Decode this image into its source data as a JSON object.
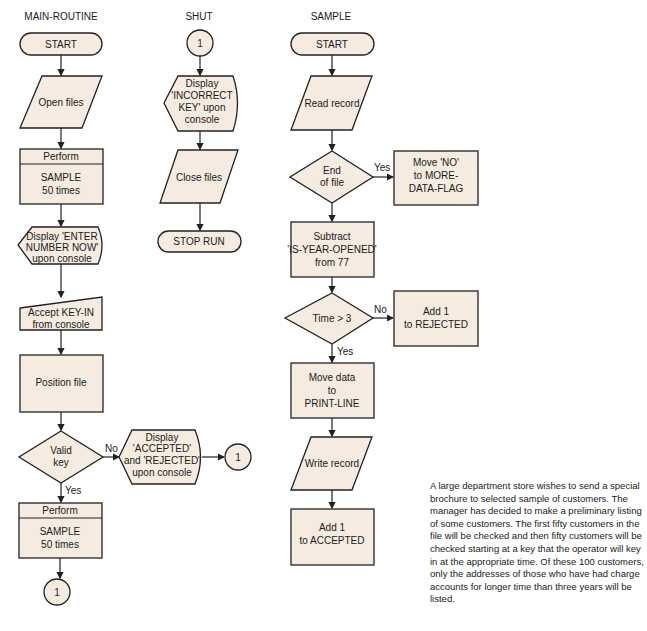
{
  "columns": {
    "main": {
      "title": "MAIN-ROUTINE",
      "start": "START",
      "open_files": "Open files",
      "perform1": {
        "header": "Perform",
        "line1": "SAMPLE",
        "line2": "50 times"
      },
      "display_enter": {
        "line1": "Display 'ENTER",
        "line2": "NUMBER NOW'",
        "line3": "upon console"
      },
      "accept": {
        "line1": "Accept KEY-IN",
        "line2": "from console"
      },
      "position": "Position file",
      "valid_key": {
        "line1": "Valid",
        "line2": "key"
      },
      "no_label": "No",
      "yes_label": "Yes",
      "display_accepted": {
        "line1": "Display",
        "line2": "'ACCEPTED'",
        "line3": "and 'REJECTED'",
        "line4": "upon console"
      },
      "connector_right": "1",
      "perform2": {
        "header": "Perform",
        "line1": "SAMPLE",
        "line2": "50 times"
      },
      "connector_bottom": "1"
    },
    "shut": {
      "title": "SHUT",
      "connector": "1",
      "display_incorrect": {
        "line1": "Display",
        "line2": "'INCORRECT",
        "line3": "KEY' upon",
        "line4": "console"
      },
      "close_files": "Close files",
      "stop": "STOP RUN"
    },
    "sample": {
      "title": "SAMPLE",
      "start": "START",
      "read": "Read record",
      "eof": {
        "line1": "End",
        "line2": "of file"
      },
      "yes_label": "Yes",
      "move_no": {
        "line1": "Move 'NO'",
        "line2": "to MORE-",
        "line3": "DATA-FLAG"
      },
      "subtract": {
        "line1": "Subtract",
        "line2": "'IS-YEAR-OPENED'",
        "line3": "from 77"
      },
      "time": "Time > 3",
      "no_label": "No",
      "yes2_label": "Yes",
      "add_rejected": {
        "line1": "Add 1",
        "line2": "to REJECTED"
      },
      "move_data": {
        "line1": "Move data",
        "line2": "to",
        "line3": "PRINT-LINE"
      },
      "write": "Write record",
      "add_accepted": {
        "line1": "Add 1",
        "line2": "to ACCEPTED"
      }
    }
  },
  "description": "A large department store wishes to send a special brochure to selected sample of customers. The manager has decided to make a preliminary listing of some customers. The first fifty customers in the file will be checked and then fifty customers will be checked starting at a key that the operator will key in at the appropriate time. Of these 100 customers, only the addresses of those who have had charge accounts for longer time than three years will be listed.",
  "colors": {
    "fill": "#f6ebe0",
    "stroke": "#222222"
  }
}
